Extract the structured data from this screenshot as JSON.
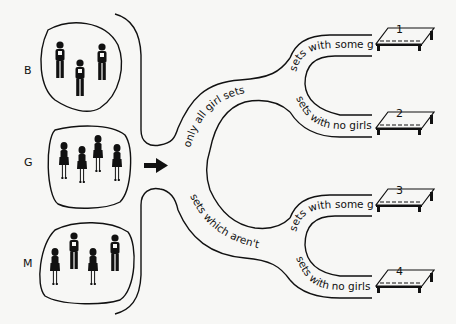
{
  "groups": [
    {
      "id": "B",
      "label": "B",
      "members": [
        "boy",
        "boy",
        "boy"
      ]
    },
    {
      "id": "G",
      "label": "G",
      "members": [
        "girl",
        "girl",
        "girl",
        "girl"
      ]
    },
    {
      "id": "M",
      "label": "M",
      "members": [
        "girl",
        "boy",
        "girl",
        "boy"
      ]
    }
  ],
  "arrow": {
    "direction": "right"
  },
  "branches": {
    "first_level": [
      {
        "id": "all-girl",
        "label": "only all girl sets"
      },
      {
        "id": "not-all-girl",
        "label": "sets which aren't all girls"
      }
    ],
    "second_level": [
      {
        "parent": "all-girl",
        "label": "sets with some girls",
        "table": "1"
      },
      {
        "parent": "all-girl",
        "label": "sets with no girls",
        "table": "2"
      },
      {
        "parent": "not-all-girl",
        "label": "sets with some girls",
        "table": "3"
      },
      {
        "parent": "not-all-girl",
        "label": "sets with no girls",
        "table": "4"
      }
    ]
  },
  "tables": [
    {
      "number": "1"
    },
    {
      "number": "2"
    },
    {
      "number": "3"
    },
    {
      "number": "4"
    }
  ],
  "colors": {
    "ink": "#111111",
    "paper": "#f7f7f5"
  }
}
